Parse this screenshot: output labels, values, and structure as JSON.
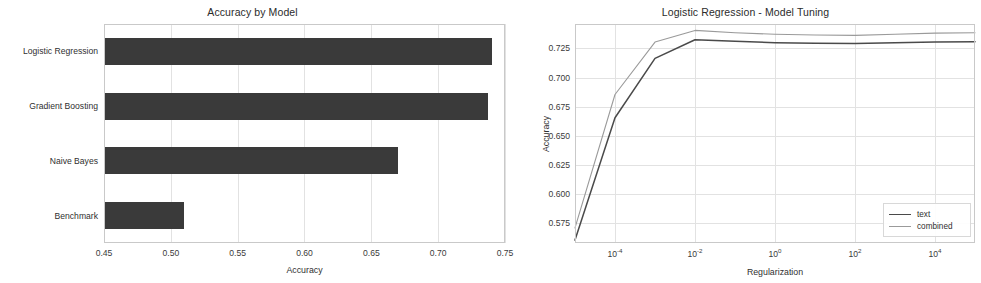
{
  "figure": {
    "background": "#ffffff",
    "width": 981,
    "height": 283
  },
  "panels": [
    {
      "id": "accuracy-by-model",
      "title": "Accuracy by Model"
    },
    {
      "id": "model-tuning",
      "title": "Logistic Regression - Model Tuning"
    }
  ],
  "chart_data": [
    {
      "type": "bar",
      "orientation": "horizontal",
      "title": "Accuracy by Model",
      "xlabel": "Accuracy",
      "ylabel": "",
      "categories": [
        "Benchmark",
        "Naive Bayes",
        "Gradient Boosting",
        "Logistic Regression"
      ],
      "values": [
        0.51,
        0.67,
        0.737,
        0.74
      ],
      "xlim": [
        0.45,
        0.75
      ],
      "xticks": [
        0.45,
        0.5,
        0.55,
        0.6,
        0.65,
        0.7,
        0.75
      ],
      "xticklabels": [
        "0.45",
        "0.50",
        "0.55",
        "0.60",
        "0.65",
        "0.70",
        "0.75"
      ],
      "grid": true,
      "bar_color": "#3a3a3a",
      "legend": null
    },
    {
      "type": "line",
      "title": "Logistic Regression - Model Tuning",
      "xlabel": "Regularization",
      "ylabel": "Accuracy",
      "xscale": "log",
      "xlim": [
        1e-05,
        100000.0
      ],
      "ylim": [
        0.558,
        0.746
      ],
      "xticks": [
        0.0001,
        0.01,
        1,
        100,
        10000
      ],
      "xticklabels": [
        "10-4",
        "10-2",
        "100",
        "102",
        "104"
      ],
      "xtick_exponents": [
        "-4",
        "-2",
        "0",
        "2",
        "4"
      ],
      "yticks": [
        0.575,
        0.6,
        0.625,
        0.65,
        0.675,
        0.7,
        0.725
      ],
      "yticklabels": [
        "0.575",
        "0.600",
        "0.625",
        "0.650",
        "0.675",
        "0.700",
        "0.725"
      ],
      "grid": true,
      "legend_position": "lower right",
      "x": [
        1e-05,
        0.0001,
        0.001,
        0.01,
        0.1,
        1,
        10,
        100,
        1000,
        10000,
        100000
      ],
      "series": [
        {
          "name": "text",
          "color": "#4a4a4a",
          "style": "solid",
          "values": [
            0.5605,
            0.6655,
            0.7165,
            0.7325,
            0.7312,
            0.73,
            0.7295,
            0.7292,
            0.7298,
            0.7305,
            0.7308
          ]
        },
        {
          "name": "combined",
          "color": "#9a9a9a",
          "style": "solid-light",
          "values": [
            0.571,
            0.6855,
            0.7305,
            0.7405,
            0.7385,
            0.7372,
            0.7365,
            0.7362,
            0.7372,
            0.7382,
            0.7385
          ]
        }
      ]
    }
  ]
}
